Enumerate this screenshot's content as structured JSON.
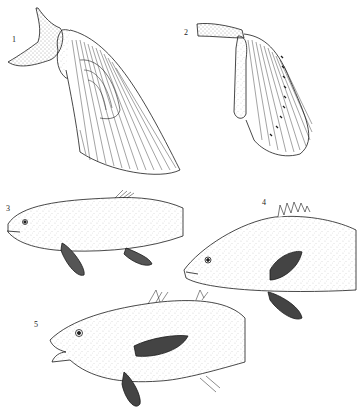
{
  "plate": {
    "figures": [
      {
        "number": "1",
        "subject": "pectoral-fin-lobed",
        "label_pos": [
          12,
          40
        ]
      },
      {
        "number": "2",
        "subject": "pectoral-fin-rayed",
        "label_pos": [
          184,
          33
        ]
      },
      {
        "number": "3",
        "subject": "fish-elongate-pelvic-abdominal",
        "label_pos": [
          6,
          208
        ]
      },
      {
        "number": "4",
        "subject": "fish-spiny-dorsal-pelvic-thoracic",
        "label_pos": [
          262,
          202
        ]
      },
      {
        "number": "5",
        "subject": "fish-pelvic-jugular",
        "label_pos": [
          34,
          324
        ]
      }
    ]
  },
  "colors": {
    "ink": "#1a1a1a",
    "background": "#ffffff",
    "stipple": "#555555"
  }
}
